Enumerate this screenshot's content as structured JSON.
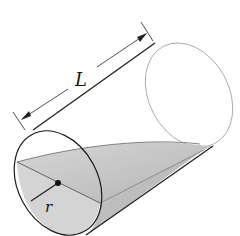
{
  "figure": {
    "labels": {
      "length": "L",
      "radius": "r"
    },
    "colors": {
      "outline": "#1a1a1a",
      "hidden_edge": "#9a9a9a",
      "wedge_fill": "#c4c4c4",
      "wedge_fill_light": "#dedede",
      "background": "#ffffff"
    }
  }
}
